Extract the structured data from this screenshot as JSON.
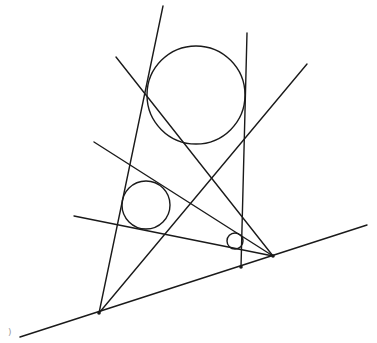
{
  "diagram": {
    "type": "geometry-construction",
    "stroke_color": "#1a1a1a",
    "background": "#ffffff",
    "base_line": {
      "x1": 20,
      "y1": 337,
      "x2": 367,
      "y2": 225
    },
    "points": [
      {
        "id": "A",
        "x": 99,
        "y": 313
      },
      {
        "id": "B",
        "x": 241,
        "y": 267
      },
      {
        "id": "C",
        "x": 273,
        "y": 256
      }
    ],
    "circles": [
      {
        "id": "large",
        "cx": 196,
        "cy": 95,
        "r": 49
      },
      {
        "id": "medium",
        "cx": 146,
        "cy": 205,
        "r": 24
      },
      {
        "id": "small",
        "cx": 235,
        "cy": 241,
        "r": 8
      }
    ],
    "lines": [
      {
        "id": "A-steep",
        "x1": 99,
        "y1": 313,
        "x2": 163,
        "y2": 6
      },
      {
        "id": "B-vertical",
        "x1": 241,
        "y1": 267,
        "x2": 247,
        "y2": 33
      },
      {
        "id": "A-diagonal",
        "x1": 99,
        "y1": 313,
        "x2": 307,
        "y2": 64
      },
      {
        "id": "C-long",
        "x1": 116,
        "y1": 57,
        "x2": 273,
        "y2": 256
      },
      {
        "id": "C-middle",
        "x1": 94,
        "y1": 142,
        "x2": 273,
        "y2": 256
      },
      {
        "id": "C-low",
        "x1": 74,
        "y1": 216,
        "x2": 273,
        "y2": 256
      }
    ],
    "corner_mark": {
      "x": 8,
      "y": 335,
      "text": ")"
    }
  }
}
